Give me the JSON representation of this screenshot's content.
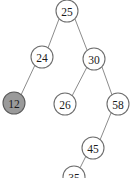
{
  "diagram": {
    "type": "binary-search-tree",
    "background_color": "#ffffff",
    "edge_color": "#8c8c8c",
    "node_fill": "#ffffff",
    "node_stroke": "#6e6e6e",
    "highlight_fill": "#9a9a9a",
    "label_color": "#1a1a1a",
    "width": 132,
    "height": 178
  },
  "nodes": [
    {
      "id": "n25",
      "label": "25",
      "cx": 67,
      "cy": 11,
      "r": 11,
      "highlighted": false,
      "level": 0,
      "clipped": false
    },
    {
      "id": "n24",
      "label": "24",
      "cx": 42,
      "cy": 57,
      "r": 11,
      "highlighted": false,
      "level": 1,
      "clipped": false
    },
    {
      "id": "n30",
      "label": "30",
      "cx": 94,
      "cy": 59,
      "r": 11,
      "highlighted": false,
      "level": 1,
      "clipped": false
    },
    {
      "id": "n12",
      "label": "12",
      "cx": 14,
      "cy": 103,
      "r": 11,
      "highlighted": true,
      "level": 2,
      "clipped": false
    },
    {
      "id": "n26",
      "label": "26",
      "cx": 65,
      "cy": 104,
      "r": 11,
      "highlighted": false,
      "level": 2,
      "clipped": false
    },
    {
      "id": "n58",
      "label": "58",
      "cx": 118,
      "cy": 104,
      "r": 11,
      "highlighted": false,
      "level": 2,
      "clipped": false
    },
    {
      "id": "n45",
      "label": "45",
      "cx": 93,
      "cy": 148,
      "r": 11,
      "highlighted": false,
      "level": 3,
      "clipped": false
    },
    {
      "id": "nclip",
      "label": "35",
      "cx": 74,
      "cy": 177,
      "r": 11,
      "highlighted": false,
      "level": 4,
      "clipped": true
    }
  ],
  "edges": [
    {
      "id": "e25-24",
      "from": "n25",
      "to": "n24",
      "x1": 59,
      "y1": 19,
      "x2": 48,
      "y2": 48
    },
    {
      "id": "e25-30",
      "from": "n25",
      "to": "n30",
      "x1": 75,
      "y1": 19,
      "x2": 87,
      "y2": 50
    },
    {
      "id": "e24-12",
      "from": "n24",
      "to": "n12",
      "x1": 35,
      "y1": 65,
      "x2": 21,
      "y2": 95
    },
    {
      "id": "e30-26",
      "from": "n30",
      "to": "n26",
      "x1": 87,
      "y1": 67,
      "x2": 72,
      "y2": 96
    },
    {
      "id": "e30-58",
      "from": "n30",
      "to": "n58",
      "x1": 102,
      "y1": 67,
      "x2": 112,
      "y2": 95
    },
    {
      "id": "e58-45",
      "from": "n58",
      "to": "n45",
      "x1": 111,
      "y1": 113,
      "x2": 100,
      "y2": 140
    },
    {
      "id": "e45-clip",
      "from": "n45",
      "to": "nclip",
      "x1": 86,
      "y1": 156,
      "x2": 79,
      "y2": 170
    }
  ]
}
